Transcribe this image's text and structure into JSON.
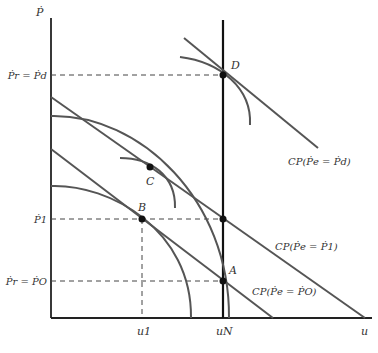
{
  "diagram": {
    "axes": {
      "y_label": "Ṗ",
      "x_label": "u"
    },
    "y_ticks": [
      {
        "id": "pd",
        "label": "Ṗr = Ṗd"
      },
      {
        "id": "p1",
        "label": "Ṗ1"
      },
      {
        "id": "po",
        "label": "Ṗr = ṖO"
      }
    ],
    "x_ticks": [
      {
        "id": "u1",
        "label": "u1"
      },
      {
        "id": "uN",
        "label": "uN"
      }
    ],
    "points": [
      {
        "id": "A",
        "label": "A"
      },
      {
        "id": "B",
        "label": "B"
      },
      {
        "id": "C",
        "label": "C"
      },
      {
        "id": "D",
        "label": "D"
      }
    ],
    "curves": [
      {
        "id": "cp_pd",
        "label": "CP(Ṗe = Ṗd)"
      },
      {
        "id": "cp_p1",
        "label": "CP(Ṗe = Ṗ1)"
      },
      {
        "id": "cp_po",
        "label": "CP(Ṗe = ṖO)"
      }
    ],
    "colors": {
      "curve": "#555555",
      "axis": "#222222",
      "dash": "#444444"
    }
  }
}
